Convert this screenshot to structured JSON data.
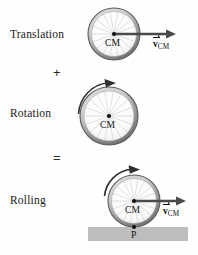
{
  "figure": {
    "background_color": "#fefefe"
  },
  "rows": [
    {
      "id": "translation",
      "label": "Translation",
      "label_x": 10,
      "label_y": 28,
      "wheel": {
        "cx": 114,
        "cy": 34,
        "r": 26
      },
      "cm_dot": true,
      "cm_label": "CM",
      "has_velocity_arrow": true,
      "velocity_label_v": "v",
      "velocity_label_sub": "CM",
      "has_rotation_arrow": false,
      "has_ground": false
    },
    {
      "id": "rotation",
      "label": "Rotation",
      "label_x": 10,
      "label_y": 107,
      "wheel": {
        "cx": 109,
        "cy": 116,
        "r": 29
      },
      "cm_dot": true,
      "cm_label": "CM",
      "has_velocity_arrow": false,
      "velocity_label_v": "",
      "velocity_label_sub": "",
      "has_rotation_arrow": true,
      "has_ground": false
    },
    {
      "id": "rolling",
      "label": "Rolling",
      "label_x": 10,
      "label_y": 194,
      "wheel": {
        "cx": 134,
        "cy": 201,
        "r": 26
      },
      "cm_dot": true,
      "cm_label": "CM",
      "has_velocity_arrow": true,
      "velocity_label_v": "v",
      "velocity_label_sub": "CM",
      "has_rotation_arrow": true,
      "has_ground": true,
      "contact_point_label": "P"
    }
  ],
  "operators": [
    {
      "id": "plus",
      "symbol": "+",
      "x": 53,
      "y": 66
    },
    {
      "id": "equals",
      "symbol": "=",
      "x": 53,
      "y": 152
    }
  ],
  "ground": {
    "x": 88,
    "y": 227,
    "width": 100,
    "height": 14,
    "color": "#bdbdbd"
  },
  "colors": {
    "rim_dark": "#5a5a5a",
    "rim_light": "#c8c8c8",
    "spoke": "#b4b4b4",
    "arrow": "#4a4a4a",
    "text": "#111111",
    "ground": "#bdbdbd"
  },
  "icons": {
    "wheel": "wheel-icon",
    "velocity_arrow": "velocity-arrow-icon",
    "rotation_arrow": "rotation-arrow-icon",
    "center-of-mass-dot": "cm-dot-icon",
    "contact-point-dot": "contact-point-icon"
  }
}
